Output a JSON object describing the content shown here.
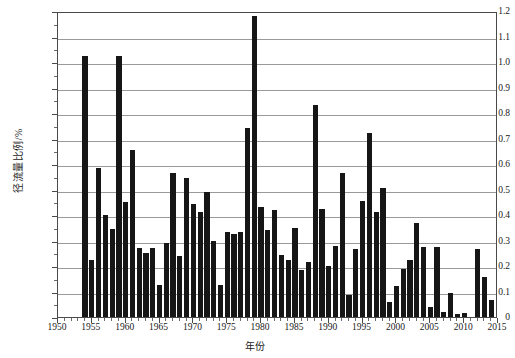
{
  "chart_data": {
    "type": "bar",
    "title": "",
    "xlabel": "年份",
    "ylabel": "径流量比例/%",
    "xlim": [
      1950,
      2015
    ],
    "ylim": [
      0,
      1.2
    ],
    "y_tick_step": 0.1,
    "x_tick_step": 5,
    "x_minor_tick_step": 1,
    "grid": "horizontal",
    "legend": "none",
    "bar_color": "#161616",
    "axis_color": "#4a4a4a",
    "gridline_color": "#9a9a9a",
    "y_tick_labels": [
      "0",
      "0.1",
      "0.2",
      "0.3",
      "0.4",
      "0.5",
      "0.6",
      "0.7",
      "0.8",
      "0.9",
      "1.0",
      "1.1",
      "1.2"
    ],
    "y_tick_values": [
      0,
      0.1,
      0.2,
      0.3,
      0.4,
      0.5,
      0.6,
      0.7,
      0.8,
      0.9,
      1.0,
      1.1,
      1.2
    ],
    "x_tick_labels": [
      "1950",
      "1955",
      "1960",
      "1965",
      "1970",
      "1975",
      "1980",
      "1985",
      "1990",
      "1995",
      "2000",
      "2005",
      "2010",
      "2015"
    ],
    "x_tick_values": [
      1950,
      1955,
      1960,
      1965,
      1970,
      1975,
      1980,
      1985,
      1990,
      1995,
      2000,
      2005,
      2010,
      2015
    ],
    "categories": [
      1954,
      1955,
      1956,
      1957,
      1958,
      1959,
      1960,
      1961,
      1962,
      1963,
      1964,
      1965,
      1966,
      1967,
      1968,
      1969,
      1970,
      1971,
      1972,
      1973,
      1974,
      1975,
      1976,
      1977,
      1978,
      1979,
      1980,
      1981,
      1982,
      1983,
      1984,
      1985,
      1986,
      1987,
      1988,
      1989,
      1990,
      1991,
      1992,
      1993,
      1994,
      1995,
      1996,
      1997,
      1998,
      1999,
      2000,
      2001,
      2002,
      2003,
      2004,
      2005,
      2006,
      2007,
      2008,
      2009,
      2010,
      2011,
      2012,
      2013,
      2014
    ],
    "values": [
      1.025,
      0.225,
      0.585,
      0.4,
      0.345,
      1.025,
      0.45,
      0.655,
      0.27,
      0.25,
      0.27,
      0.125,
      0.29,
      0.565,
      0.24,
      0.545,
      0.445,
      0.41,
      0.49,
      0.3,
      0.125,
      0.335,
      0.325,
      0.335,
      0.74,
      1.18,
      0.43,
      0.34,
      0.42,
      0.245,
      0.225,
      0.35,
      0.185,
      0.215,
      0.83,
      0.425,
      0.2,
      0.28,
      0.565,
      0.085,
      0.265,
      0.455,
      0.72,
      0.41,
      0.505,
      0.06,
      0.12,
      0.19,
      0.225,
      0.37,
      0.275,
      0.04,
      0.275,
      0.02,
      0.095,
      0.01,
      0.015,
      0.0,
      0.265,
      0.155,
      0.065
    ]
  },
  "axes": {
    "y_title": "径流量比例/%",
    "x_title": "年份"
  }
}
